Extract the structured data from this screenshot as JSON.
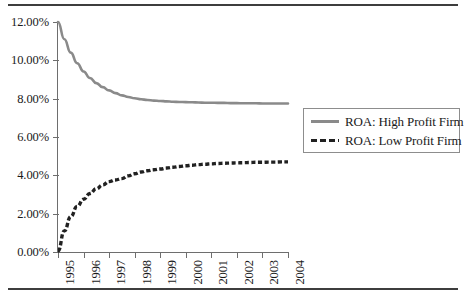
{
  "chart_data": {
    "type": "line",
    "title": "",
    "subtitle": "",
    "xlabel": "",
    "ylabel": "",
    "grid": false,
    "legend_position": "right",
    "ylim": [
      0,
      12
    ],
    "ytick_labels": [
      "0.00%",
      "2.00%",
      "4.00%",
      "6.00%",
      "8.00%",
      "10.00%",
      "12.00%"
    ],
    "ytick_values": [
      0,
      2,
      4,
      6,
      8,
      10,
      12
    ],
    "categories": [
      "1995",
      "1996",
      "1997",
      "1998",
      "1999",
      "2000",
      "2001",
      "2002",
      "2003",
      "2004"
    ],
    "x": [
      1995,
      1996,
      1997,
      1998,
      1999,
      2000,
      2001,
      2002,
      2003,
      2004
    ],
    "series": [
      {
        "name": "ROA: High Profit Firm",
        "style": "solid",
        "color": "#8a8a8a",
        "values": [
          12.0,
          9.85,
          8.73,
          8.17,
          7.95,
          7.84,
          7.79,
          7.77,
          7.76,
          7.75
        ],
        "dense_values": [
          12.0,
          11.1,
          10.4,
          9.85,
          9.42,
          9.08,
          8.81,
          8.6,
          8.43,
          8.29,
          8.17,
          8.09,
          8.02,
          7.97,
          7.93,
          7.9,
          7.88,
          7.86,
          7.84,
          7.83,
          7.82,
          7.81,
          7.8,
          7.79,
          7.79,
          7.78,
          7.78,
          7.77,
          7.77,
          7.76,
          7.76,
          7.76,
          7.75,
          7.75,
          7.75,
          7.75,
          7.75
        ]
      },
      {
        "name": "ROA: Low Profit Firm",
        "style": "dashed",
        "color": "#212121",
        "values": [
          0.05,
          2.75,
          3.83,
          4.32,
          4.54,
          4.63,
          4.67,
          4.69,
          4.7,
          4.7
        ],
        "dense_values": [
          0.05,
          1.1,
          1.85,
          2.38,
          2.75,
          3.05,
          3.3,
          3.5,
          3.67,
          3.76,
          3.83,
          3.97,
          4.08,
          4.17,
          4.24,
          4.29,
          4.33,
          4.38,
          4.42,
          4.46,
          4.5,
          4.53,
          4.56,
          4.58,
          4.6,
          4.62,
          4.63,
          4.64,
          4.65,
          4.66,
          4.67,
          4.68,
          4.68,
          4.69,
          4.69,
          4.7,
          4.7
        ]
      }
    ]
  },
  "legend": {
    "items": [
      {
        "label": "ROA: High Profit Firm"
      },
      {
        "label": "ROA: Low Profit Firm"
      }
    ]
  }
}
